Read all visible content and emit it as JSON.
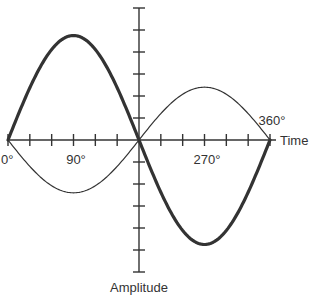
{
  "chart_data": {
    "type": "line",
    "title": "",
    "xlabel": "Time",
    "ylabel": "Amplitude",
    "x_unit": "degrees",
    "xlim": [
      0,
      360
    ],
    "ylim": [
      -6,
      6
    ],
    "x_ticks_step": 30,
    "y_ticks_step": 1,
    "x_tick_labels": [
      {
        "value": 0,
        "label": "0°"
      },
      {
        "value": 90,
        "label": "90°"
      },
      {
        "value": 270,
        "label": "270°"
      },
      {
        "value": 360,
        "label": "360°"
      }
    ],
    "grid": false,
    "legend": "none",
    "series": [
      {
        "name": "wave-thick",
        "function": "sine",
        "amplitude": 4.75,
        "phase_deg": 0,
        "color": "#333333",
        "weight": "thick"
      },
      {
        "name": "wave-thin",
        "function": "sine",
        "amplitude": -2.4,
        "phase_deg": 0,
        "color": "#333333",
        "weight": "thin"
      }
    ]
  }
}
